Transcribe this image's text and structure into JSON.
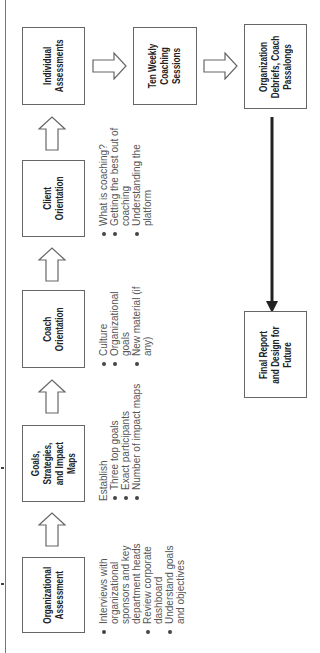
{
  "diagram": {
    "orientation": "rotated-90-ccw",
    "flow_row": [
      {
        "id": "organizational-assessment",
        "title": "Organizational\nAssessment",
        "bullets": [
          "Interviews with organizational sponsors and key department heads",
          "Review corporate dashboard",
          "Understand goals and objectives"
        ]
      },
      {
        "id": "goals-strategies-impact-maps",
        "title": "Goals,\nStrategies,\nand Impact\nMaps",
        "lead": "Establish",
        "bullets": [
          "Three top goals",
          "Exact participants",
          "Number of impact maps"
        ]
      },
      {
        "id": "coach-orientation",
        "title": "Coach\nOrientation",
        "bullets": [
          "Culture",
          "Organizational goals",
          "New material (if any)"
        ]
      },
      {
        "id": "client-orientation",
        "title": "Client\nOrientation",
        "bullets": [
          "What is coaching?",
          "Getting the best out of coaching",
          "Understanding the platform"
        ]
      },
      {
        "id": "individual-assessments",
        "title": "Individual\nAssessments"
      }
    ],
    "right_column": [
      {
        "id": "ten-weekly-coaching-sessions",
        "title": "Ten Weekly\nCoaching\nSessions"
      },
      {
        "id": "organization-debriefs",
        "title": "Organization\nDebriefs, Coach\nPassalongs"
      }
    ],
    "final": {
      "id": "final-report",
      "title": "Final Report\nand Design for\nFuture"
    },
    "colors": {
      "box_border": "#666666",
      "text": "#222222",
      "bullet_text": "#555555",
      "arrow_solid": "#222222"
    }
  }
}
